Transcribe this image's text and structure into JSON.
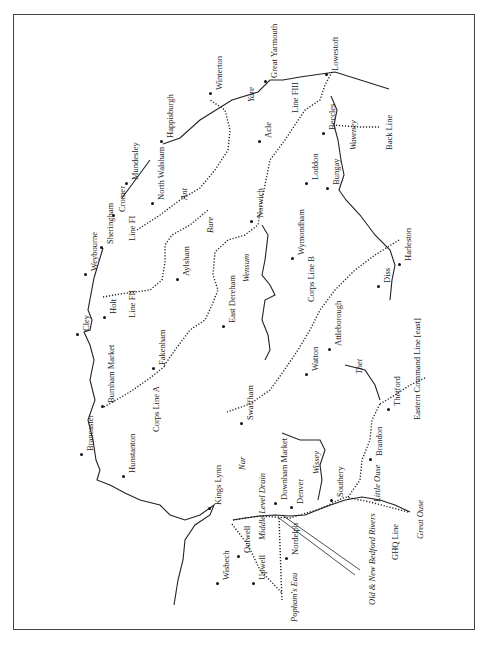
{
  "map": {
    "title": "",
    "orientation": "rotated 90° (north to left)",
    "towns": [
      {
        "name": "Great Yarmouth",
        "x": 270,
        "y": 78
      },
      {
        "name": "Lowestoft",
        "x": 331,
        "y": 71
      },
      {
        "name": "Winterton",
        "x": 215,
        "y": 90
      },
      {
        "name": "Happisburgh",
        "x": 166,
        "y": 138
      },
      {
        "name": "Mundesley",
        "x": 131,
        "y": 180
      },
      {
        "name": "North Walsham",
        "x": 157,
        "y": 200
      },
      {
        "name": "Cromer",
        "x": 118,
        "y": 212
      },
      {
        "name": "Sheringham",
        "x": 106,
        "y": 244
      },
      {
        "name": "Weybourne",
        "x": 90,
        "y": 271
      },
      {
        "name": "Holt",
        "x": 109,
        "y": 314
      },
      {
        "name": "Cley",
        "x": 82,
        "y": 331
      },
      {
        "name": "Burnham Market",
        "x": 107,
        "y": 403
      },
      {
        "name": "Fakenham",
        "x": 158,
        "y": 365
      },
      {
        "name": "Brancaster",
        "x": 86,
        "y": 451
      },
      {
        "name": "Hunstanton",
        "x": 128,
        "y": 473
      },
      {
        "name": "Kings Lynn",
        "x": 214,
        "y": 505
      },
      {
        "name": "Aylsham",
        "x": 182,
        "y": 276
      },
      {
        "name": "Acle",
        "x": 264,
        "y": 138
      },
      {
        "name": "Norwich",
        "x": 256,
        "y": 218
      },
      {
        "name": "Wymondham",
        "x": 297,
        "y": 255
      },
      {
        "name": "East Dereham",
        "x": 228,
        "y": 323
      },
      {
        "name": "Attleborough",
        "x": 334,
        "y": 346
      },
      {
        "name": "Watton",
        "x": 311,
        "y": 371
      },
      {
        "name": "Swaffham",
        "x": 246,
        "y": 420
      },
      {
        "name": "Downham Market",
        "x": 280,
        "y": 500
      },
      {
        "name": "Denver",
        "x": 296,
        "y": 504
      },
      {
        "name": "Southery",
        "x": 336,
        "y": 497
      },
      {
        "name": "Brandon",
        "x": 375,
        "y": 456
      },
      {
        "name": "Thetford",
        "x": 393,
        "y": 406
      },
      {
        "name": "Diss",
        "x": 383,
        "y": 283
      },
      {
        "name": "Harleston",
        "x": 404,
        "y": 261
      },
      {
        "name": "Beccles",
        "x": 328,
        "y": 130
      },
      {
        "name": "Loddon",
        "x": 311,
        "y": 180
      },
      {
        "name": "Bungay",
        "x": 332,
        "y": 185
      },
      {
        "name": "Outwell",
        "x": 243,
        "y": 553
      },
      {
        "name": "Upwell",
        "x": 258,
        "y": 580
      },
      {
        "name": "Wisbech",
        "x": 222,
        "y": 580
      },
      {
        "name": "Nordelph",
        "x": 291,
        "y": 555
      }
    ],
    "rivers": [
      {
        "name": "Yare",
        "x": 247,
        "y": 102
      },
      {
        "name": "Ant",
        "x": 180,
        "y": 200
      },
      {
        "name": "Bure",
        "x": 206,
        "y": 233
      },
      {
        "name": "Wensum",
        "x": 242,
        "y": 282
      },
      {
        "name": "Thet",
        "x": 355,
        "y": 374
      },
      {
        "name": "Nar",
        "x": 238,
        "y": 470
      },
      {
        "name": "Wissey",
        "x": 312,
        "y": 474
      },
      {
        "name": "Little Ouse",
        "x": 373,
        "y": 502
      },
      {
        "name": "Waveney",
        "x": 349,
        "y": 150
      },
      {
        "name": "Great Ouse",
        "x": 416,
        "y": 539
      },
      {
        "name": "Middle Level Drain",
        "x": 258,
        "y": 540
      },
      {
        "name": "Popham's Eau",
        "x": 290,
        "y": 622
      },
      {
        "name": "Old & New Bedford Rivers",
        "x": 368,
        "y": 605
      }
    ],
    "defence_lines": [
      {
        "name": "Line FIII",
        "x": 291,
        "y": 113
      },
      {
        "name": "Back Line",
        "x": 385,
        "y": 150
      },
      {
        "name": "Line FI",
        "x": 128,
        "y": 241
      },
      {
        "name": "Line FII",
        "x": 128,
        "y": 318
      },
      {
        "name": "Corps Line A",
        "x": 152,
        "y": 432
      },
      {
        "name": "Corps Line B",
        "x": 307,
        "y": 302
      },
      {
        "name": "Eastern Command Line [east]",
        "x": 413,
        "y": 420
      },
      {
        "name": "GHQ Line",
        "x": 391,
        "y": 560
      }
    ]
  }
}
